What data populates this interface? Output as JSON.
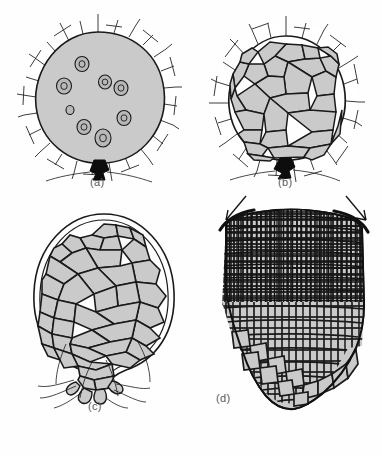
{
  "figure": {
    "background_color": "#fefefe",
    "cell_fill_color": "#cacaca",
    "line_color": "#1a1a1a",
    "jacket_fill_color": "#ffffff",
    "foot_color": "#0d0d0d",
    "label_color": "#5a5a5a"
  },
  "panels": [
    {
      "id": "a",
      "label": "(a)",
      "description": "young coenocytic sporophyte embryo enclosed in calyptra jacket with free nuclei and dark basal foot",
      "nuclei_count": 8,
      "has_foot": true,
      "has_jacket": true,
      "has_rhizoids": false,
      "arrow_count": 0
    },
    {
      "id": "b",
      "label": "(b)",
      "description": "cellularized embryo divided into polygonal cells, still enclosed in jacket, dark basal foot",
      "nuclei_count": 0,
      "has_foot": true,
      "has_jacket": true,
      "has_rhizoids": false,
      "arrow_count": 0
    },
    {
      "id": "c",
      "label": "(c)",
      "description": "enlarged pear-shaped sporophyte with large parenchyma cells, double outer wall and basal rhizoid filaments",
      "nuclei_count": 0,
      "has_foot": false,
      "has_jacket": false,
      "has_rhizoids": true,
      "arrow_count": 0
    },
    {
      "id": "d",
      "label": "(d)",
      "description": "elongated mature sporophyte with dense apical meristematic cells grading into larger basal cells; arrows mark apical intercalary zone",
      "nuclei_count": 0,
      "has_foot": false,
      "has_jacket": false,
      "has_rhizoids": false,
      "arrow_count": 2
    }
  ]
}
